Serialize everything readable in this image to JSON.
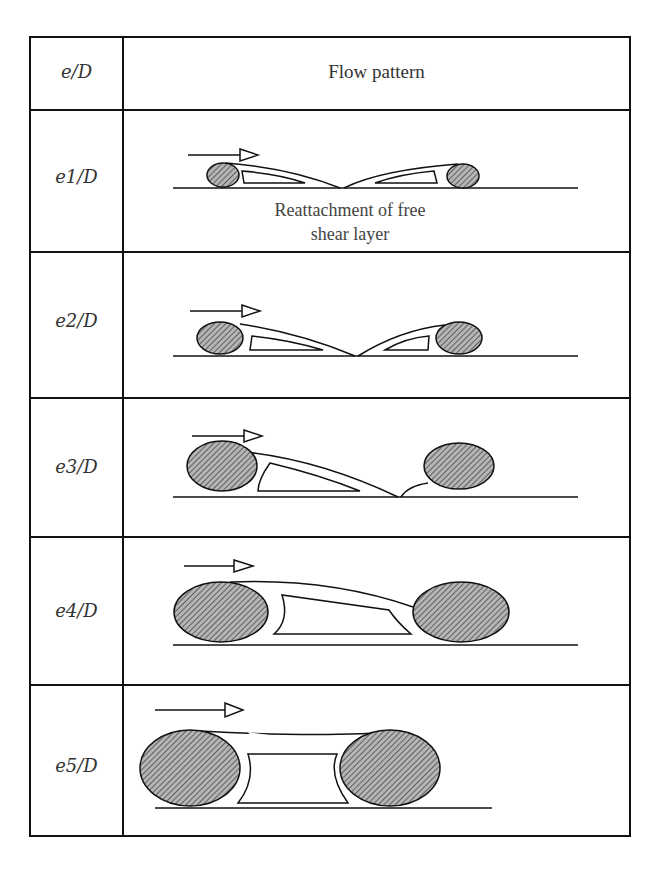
{
  "table": {
    "header": {
      "col1": "e/D",
      "col2": "Flow pattern"
    },
    "rows": [
      {
        "label_var": "e1",
        "label_suffix": "/D",
        "caption_line1": "Reattachment of free",
        "caption_line2": "shear layer",
        "pattern": "separated-shear-layers-reattach-midspan"
      },
      {
        "label_var": "e2",
        "label_suffix": "/D",
        "pattern": "separated-shear-layers-reattach-midspan"
      },
      {
        "label_var": "e3",
        "label_suffix": "/D",
        "pattern": "shear-layer-reattaches-before-downstream-cylinder"
      },
      {
        "label_var": "e4",
        "label_suffix": "/D",
        "pattern": "shear-layer-impinges-on-downstream-cylinder"
      },
      {
        "label_var": "e5",
        "label_suffix": "/D",
        "pattern": "shear-layer-bridges-both-cylinders"
      }
    ]
  },
  "colors": {
    "line": "#111111",
    "hatch": "#555555",
    "cylinder_fill": "#9a9a9a",
    "text": "#333333"
  },
  "icons": {
    "flow_arrow": "flow-direction-arrow-icon"
  }
}
